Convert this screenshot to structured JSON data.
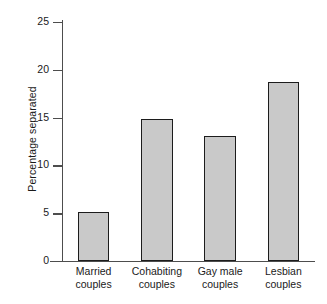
{
  "chart_data": {
    "type": "bar",
    "title": "",
    "xlabel": "",
    "ylabel": "Percentage separated",
    "ylim": [
      0,
      25
    ],
    "yticks": [
      0,
      5,
      10,
      15,
      20,
      25
    ],
    "ytick_labels": [
      "0",
      "5",
      "10",
      "15",
      "20",
      "25"
    ],
    "grid": false,
    "legend": null,
    "categories": [
      "Married couples",
      "Cohabiting couples",
      "Gay male couples",
      "Lesbian couples"
    ],
    "category_lines": [
      [
        "Married",
        "couples"
      ],
      [
        "Cohabiting",
        "couples"
      ],
      [
        "Gay male",
        "couples"
      ],
      [
        "Lesbian",
        "couples"
      ]
    ],
    "values": [
      5.1,
      14.9,
      13.1,
      18.7
    ],
    "bar_fill_color": "#c9c9c9",
    "bar_edge_color": "#1c1c1c",
    "axis_color": "#4d4d4d",
    "background_color": "#ffffff"
  }
}
